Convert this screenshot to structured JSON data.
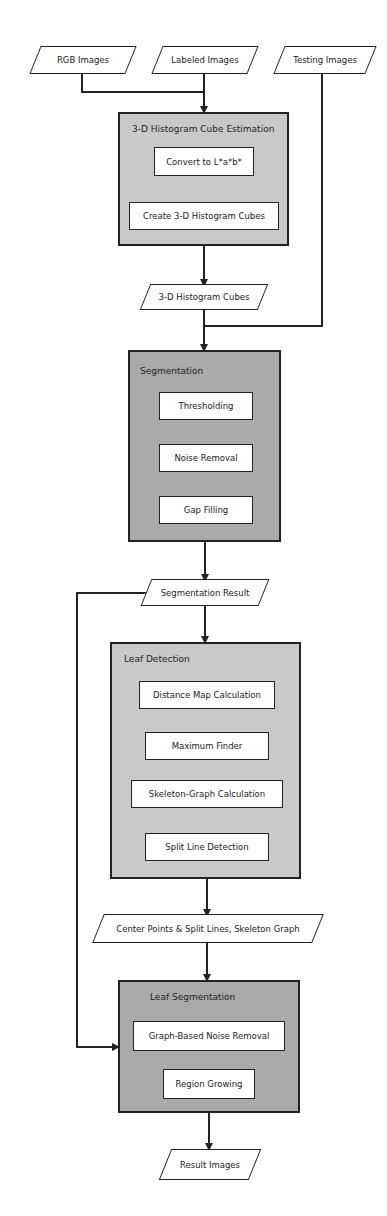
{
  "inputs": {
    "rgb": "RGB Images",
    "labeled": "Labeled Images",
    "testing": "Testing Images"
  },
  "groups": {
    "histogram": {
      "title": "3-D Histogram Cube Estimation",
      "steps": [
        "Convert to L*a*b*",
        "Create 3-D Histogram Cubes"
      ]
    },
    "segmentation": {
      "title": "Segmentation",
      "steps": [
        "Thresholding",
        "Noise Removal",
        "Gap Filling"
      ]
    },
    "leaf_detection": {
      "title": "Leaf Detection",
      "steps": [
        "Distance Map Calculation",
        "Maximum Finder",
        "Skeleton-Graph Calculation",
        "Split Line Detection"
      ]
    },
    "leaf_segmentation": {
      "title": "Leaf Segmentation",
      "steps": [
        "Graph-Based Noise Removal",
        "Region Growing"
      ]
    }
  },
  "data_nodes": {
    "histogram_cubes": "3-D Histogram Cubes",
    "segmentation_result": "Segmentation Result",
    "center_points": "Center Points & Split Lines, Skeleton Graph",
    "result_images": "Result Images"
  },
  "colors": {
    "light_group": "#c9c9c9",
    "dark_group": "#aaaaaa",
    "stroke": "#222222"
  }
}
